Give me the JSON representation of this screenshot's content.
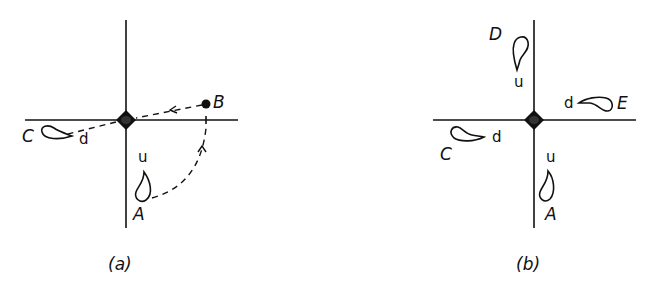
{
  "figure": {
    "panels": [
      {
        "id": "a",
        "caption": "(a)",
        "points": {
          "A": {
            "label": "A",
            "orientation_label": "u"
          },
          "B": {
            "label": "B"
          },
          "C": {
            "label": "C",
            "orientation_label": "d"
          }
        },
        "paths": [
          {
            "from": "A",
            "to": "B",
            "style": "dashed",
            "arrow": true
          },
          {
            "from": "B",
            "to": "origin",
            "style": "dashed",
            "arrow": true
          },
          {
            "from": "origin",
            "to": "C",
            "style": "dashed",
            "arrow": false
          }
        ]
      },
      {
        "id": "b",
        "caption": "(b)",
        "points": {
          "D": {
            "label": "D",
            "orientation_label": "u"
          },
          "E": {
            "label": "E",
            "orientation_label": "d"
          },
          "C": {
            "label": "C",
            "orientation_label": "d"
          },
          "A": {
            "label": "A",
            "orientation_label": "u"
          }
        }
      }
    ],
    "colors": {
      "ink": "#111111",
      "background": "#ffffff"
    }
  }
}
